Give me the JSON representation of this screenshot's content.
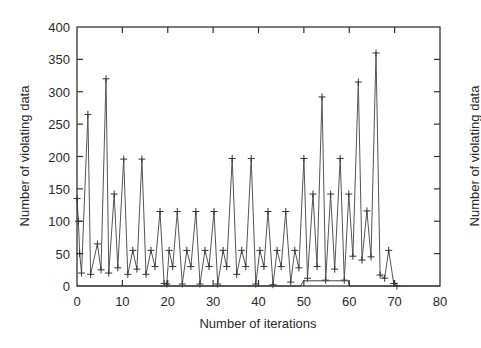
{
  "chart_data": {
    "type": "line",
    "title": "",
    "xlabel": "Number of iterations",
    "ylabel": "Number of violating data",
    "ylabel_right": "Number of violating data",
    "xlim": [
      0,
      80
    ],
    "ylim": [
      0,
      400
    ],
    "xticks": [
      0,
      10,
      20,
      30,
      40,
      50,
      60,
      70,
      80
    ],
    "yticks": [
      0,
      50,
      100,
      150,
      200,
      250,
      300,
      350,
      400
    ],
    "grid": false,
    "legend": null,
    "series": [
      {
        "name": "violating data",
        "marker": "+",
        "x": [
          0,
          0.3,
          0.6,
          1,
          2.4,
          3,
          4.5,
          5.3,
          6.4,
          7,
          8.2,
          9,
          10.3,
          11.2,
          12.3,
          13.2,
          14.3,
          15.2,
          16.3,
          17.2,
          18.3,
          19.2,
          19.8,
          20.3,
          21.1,
          22.1,
          23.2,
          24.2,
          25.1,
          26.2,
          27.1,
          28.2,
          29.1,
          30.2,
          31,
          32.2,
          33,
          34.2,
          35.2,
          36.3,
          37.2,
          38.4,
          39.4,
          40.3,
          41.2,
          42.1,
          43.2,
          44.1,
          45,
          46,
          47.1,
          48,
          48.9,
          50,
          50.8,
          52,
          52.9,
          54,
          54.8,
          55.9,
          56.8,
          58,
          58.9,
          59.9,
          60.8,
          62,
          62.8,
          63.9,
          64.8,
          65.9,
          66.8,
          67.8,
          68.7,
          69.8,
          70.5
        ],
        "y": [
          135,
          100,
          50,
          20,
          265,
          18,
          65,
          25,
          320,
          20,
          142,
          28,
          196,
          18,
          55,
          26,
          196,
          18,
          55,
          30,
          115,
          4,
          3,
          55,
          30,
          115,
          3,
          55,
          30,
          115,
          3,
          55,
          30,
          115,
          3,
          55,
          30,
          197,
          18,
          55,
          30,
          197,
          3,
          55,
          30,
          115,
          2,
          55,
          30,
          115,
          6,
          55,
          28,
          197,
          12,
          142,
          30,
          292,
          9,
          142,
          26,
          197,
          9,
          142,
          46,
          315,
          40,
          116,
          45,
          360,
          17,
          12,
          55,
          4,
          0
        ]
      },
      {
        "name": "step baseline",
        "marker": "none",
        "x": [
          0,
          49.2,
          50,
          59.8,
          60,
          80
        ],
        "y": [
          0,
          0,
          8,
          8,
          0,
          0
        ]
      }
    ]
  }
}
